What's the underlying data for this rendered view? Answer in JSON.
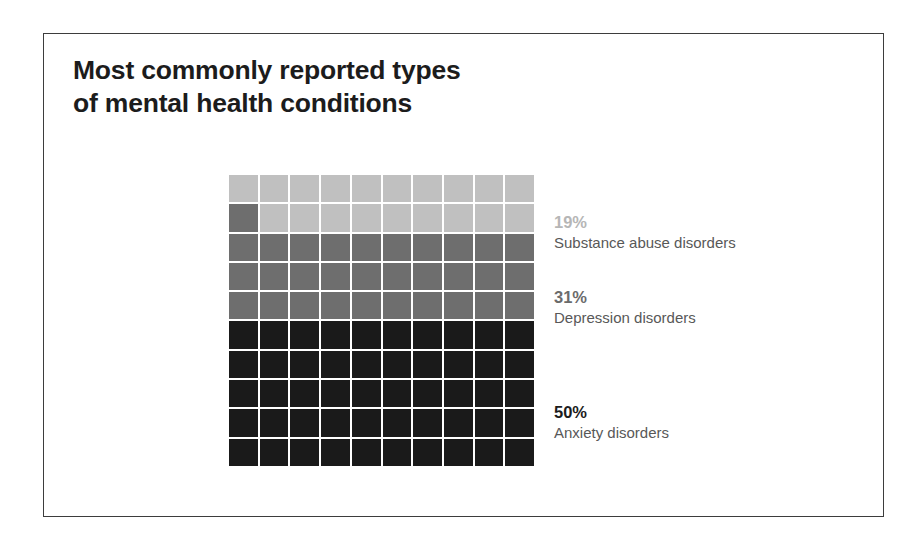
{
  "card": {
    "title": "Most commonly reported types\nof mental health conditions",
    "border_color": "#3d3d3d",
    "background_color": "#ffffff"
  },
  "chart_data": {
    "type": "waffle",
    "title": "Most commonly reported types of mental health conditions",
    "xlabel": "",
    "ylabel": "",
    "unit": "%",
    "total_cells": 100,
    "grid_rows": 10,
    "grid_columns": 10,
    "grid_gap_color": "#ffffff",
    "categories": [
      "Substance abuse disorders",
      "Depression disorders",
      "Anxiety disorders"
    ],
    "values": [
      19,
      31,
      50
    ],
    "value_labels": [
      "19%",
      "31%",
      "50%"
    ],
    "colors": [
      "#c0c0c0",
      "#6e6e6e",
      "#1a1a1a"
    ],
    "legend_position": "right",
    "series": [
      {
        "name": "Substance abuse disorders",
        "value": 19,
        "value_label": "19%",
        "color": "#c0c0c0",
        "cells": 19
      },
      {
        "name": "Depression disorders",
        "value": 31,
        "value_label": "31%",
        "color": "#6e6e6e",
        "cells": 31
      },
      {
        "name": "Anxiety disorders",
        "value": 50,
        "value_label": "50%",
        "color": "#1a1a1a",
        "cells": 50
      }
    ]
  },
  "legend": {
    "items": [
      {
        "value": "19%",
        "label": "Substance abuse disorders",
        "value_color": "#b6b6b6",
        "top": 37
      },
      {
        "value": "31%",
        "label": "Depression disorders",
        "value_color": "#6b6b6b",
        "top": 112
      },
      {
        "value": "50%",
        "label": "Anxiety disorders",
        "value_color": "#1c1c1c",
        "top": 227
      }
    ]
  }
}
